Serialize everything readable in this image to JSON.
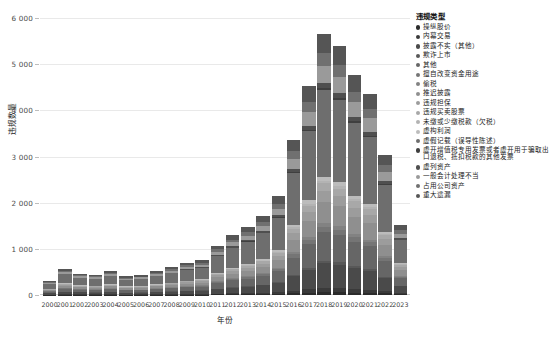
{
  "chart_data": {
    "type": "bar",
    "stacked": true,
    "title": "",
    "xlabel": "年份",
    "ylabel": "违规数量",
    "ylim": [
      0,
      6000
    ],
    "yticks": [
      0,
      1000,
      2000,
      3000,
      4000,
      5000,
      6000
    ],
    "ytick_labels": [
      "0",
      "1 000",
      "2 000",
      "3 000",
      "4 000",
      "5 000",
      "6 000"
    ],
    "grid": true,
    "legend_position": "right",
    "legend_title": "违规类型",
    "categories": [
      "2000",
      "2001",
      "2002",
      "2003",
      "2004",
      "2005",
      "2006",
      "2007",
      "2008",
      "2009",
      "2010",
      "2011",
      "2012",
      "2013",
      "2014",
      "2015",
      "2016",
      "2017",
      "2018",
      "2019",
      "2020",
      "2021",
      "2022",
      "2023"
    ],
    "totals": [
      300,
      575,
      470,
      445,
      530,
      415,
      440,
      530,
      610,
      700,
      760,
      1080,
      1310,
      1480,
      1720,
      2150,
      3390,
      4560,
      5700,
      5430,
      4790,
      4390,
      3060,
      1530
    ],
    "series": [
      {
        "name": "操纵股价",
        "color": "#2b2b2b",
        "values": [
          4,
          6,
          5,
          5,
          6,
          5,
          5,
          6,
          7,
          8,
          9,
          12,
          15,
          17,
          20,
          25,
          38,
          52,
          65,
          62,
          54,
          50,
          35,
          17
        ]
      },
      {
        "name": "内幕交易",
        "color": "#3a3a3a",
        "values": [
          5,
          9,
          7,
          7,
          8,
          6,
          7,
          8,
          9,
          11,
          12,
          17,
          21,
          23,
          27,
          34,
          53,
          72,
          90,
          86,
          76,
          69,
          48,
          24
        ]
      },
      {
        "name": "披露不实（其他）",
        "color": "#4a4a4a",
        "values": [
          28,
          54,
          44,
          42,
          50,
          39,
          41,
          50,
          57,
          66,
          71,
          101,
          123,
          139,
          161,
          202,
          318,
          428,
          535,
          510,
          450,
          412,
          287,
          144
        ]
      },
      {
        "name": "欺诈上市",
        "color": "#585858",
        "values": [
          3,
          5,
          4,
          4,
          5,
          4,
          4,
          5,
          6,
          6,
          7,
          10,
          12,
          14,
          16,
          20,
          31,
          42,
          53,
          50,
          44,
          40,
          28,
          14
        ]
      },
      {
        "name": "其他",
        "color": "#666666",
        "values": [
          33,
          63,
          52,
          49,
          58,
          46,
          48,
          58,
          67,
          77,
          84,
          119,
          144,
          163,
          189,
          236,
          373,
          501,
          627,
          597,
          527,
          483,
          337,
          168
        ]
      },
      {
        "name": "擅自改变资金用途",
        "color": "#757575",
        "values": [
          6,
          11,
          9,
          9,
          10,
          8,
          9,
          10,
          12,
          14,
          15,
          21,
          26,
          29,
          34,
          43,
          68,
          91,
          114,
          109,
          96,
          88,
          61,
          31
        ]
      },
      {
        "name": "偷税",
        "color": "#828282",
        "values": [
          4,
          8,
          6,
          6,
          7,
          6,
          6,
          7,
          8,
          10,
          10,
          15,
          18,
          20,
          24,
          30,
          47,
          63,
          79,
          75,
          66,
          61,
          42,
          21
        ]
      },
      {
        "name": "推迟披露",
        "color": "#8f8f8f",
        "values": [
          24,
          46,
          38,
          36,
          42,
          33,
          35,
          42,
          49,
          56,
          61,
          86,
          105,
          118,
          138,
          172,
          271,
          365,
          456,
          434,
          383,
          351,
          245,
          122
        ]
      },
      {
        "name": "违规担保",
        "color": "#9c9c9c",
        "values": [
          12,
          23,
          19,
          18,
          21,
          17,
          18,
          21,
          24,
          28,
          30,
          43,
          52,
          59,
          69,
          86,
          136,
          182,
          228,
          217,
          192,
          176,
          122,
          61
        ]
      },
      {
        "name": "违规买卖股票",
        "color": "#a8a8a8",
        "values": [
          9,
          17,
          14,
          13,
          16,
          12,
          13,
          16,
          18,
          21,
          23,
          32,
          39,
          44,
          52,
          65,
          102,
          137,
          171,
          163,
          144,
          132,
          92,
          46
        ]
      },
      {
        "name": "未缴或少缴税款（欠税）",
        "color": "#b3b3b3",
        "values": [
          3,
          6,
          5,
          4,
          5,
          4,
          4,
          5,
          6,
          7,
          8,
          11,
          13,
          15,
          17,
          22,
          34,
          46,
          57,
          54,
          48,
          44,
          31,
          15
        ]
      },
      {
        "name": "虚构利润",
        "color": "#bcbcbc",
        "values": [
          5,
          9,
          7,
          7,
          8,
          7,
          7,
          8,
          10,
          11,
          12,
          17,
          21,
          24,
          28,
          34,
          54,
          73,
          91,
          87,
          77,
          70,
          49,
          24
        ]
      },
      {
        "name": "虚假记载（误导性陈述）",
        "color": "#6e6e6e",
        "values": [
          99,
          190,
          155,
          147,
          175,
          137,
          145,
          175,
          201,
          231,
          251,
          356,
          432,
          489,
          568,
          710,
          1119,
          1505,
          1881,
          1792,
          1581,
          1449,
          1010,
          505
        ]
      },
      {
        "name": "虚开增值税专用发票或者虚开用于骗取出口退税、抵扣税款的其他发票",
        "color": "#3f3f3f",
        "values": [
          2,
          3,
          3,
          2,
          3,
          2,
          3,
          3,
          4,
          4,
          4,
          6,
          7,
          8,
          10,
          12,
          19,
          26,
          32,
          31,
          27,
          25,
          17,
          9
        ]
      },
      {
        "name": "虚列资产",
        "color": "#4f4f4f",
        "values": [
          6,
          11,
          9,
          9,
          10,
          8,
          9,
          10,
          12,
          14,
          15,
          21,
          26,
          29,
          34,
          43,
          68,
          91,
          114,
          109,
          96,
          88,
          61,
          31
        ]
      },
      {
        "name": "一般会计处理不当",
        "color": "#9a9a9a",
        "values": [
          20,
          38,
          31,
          29,
          35,
          27,
          29,
          35,
          40,
          46,
          50,
          71,
          86,
          97,
          113,
          141,
          222,
          299,
          374,
          356,
          314,
          288,
          201,
          100
        ]
      },
      {
        "name": "占用公司资产",
        "color": "#707070",
        "values": [
          14,
          27,
          22,
          21,
          25,
          19,
          21,
          25,
          29,
          33,
          36,
          51,
          62,
          70,
          81,
          102,
          160,
          216,
          270,
          257,
          227,
          208,
          145,
          72
        ]
      },
      {
        "name": "重大遗漏",
        "color": "#555555",
        "values": [
          23,
          44,
          36,
          34,
          40,
          32,
          33,
          40,
          46,
          53,
          57,
          81,
          99,
          112,
          130,
          162,
          256,
          344,
          430,
          410,
          361,
          331,
          231,
          115
        ]
      },
      {
        "name": "虚构利润（其他）",
        "color": "#c6c6c6",
        "values": [
          0,
          0,
          0,
          0,
          0,
          0,
          0,
          0,
          0,
          0,
          0,
          0,
          0,
          0,
          0,
          0,
          0,
          0,
          0,
          0,
          0,
          0,
          0,
          0
        ]
      }
    ]
  },
  "legend": {
    "title": "违规类型",
    "items": [
      {
        "label": "操纵股价",
        "color": "#2b2b2b"
      },
      {
        "label": "内幕交易",
        "color": "#3a3a3a"
      },
      {
        "label": "披露不实（其他）",
        "color": "#4a4a4a"
      },
      {
        "label": "欺诈上市",
        "color": "#585858"
      },
      {
        "label": "其他",
        "color": "#666666"
      },
      {
        "label": "擅自改变资金用途",
        "color": "#757575"
      },
      {
        "label": "偷税",
        "color": "#828282"
      },
      {
        "label": "推迟披露",
        "color": "#8f8f8f"
      },
      {
        "label": "违规担保",
        "color": "#9c9c9c"
      },
      {
        "label": "违规买卖股票",
        "color": "#a8a8a8"
      },
      {
        "label": "未缴或少缴税款（欠税）",
        "color": "#b3b3b3"
      },
      {
        "label": "虚构利润",
        "color": "#bcbcbc"
      },
      {
        "label": "虚假记载（误导性陈述）",
        "color": "#6e6e6e"
      },
      {
        "label": "虚开增值税专用发票或者虚开用于骗取出口退税、抵扣税款的其他发票",
        "color": "#3f3f3f"
      },
      {
        "label": "虚列资产",
        "color": "#4f4f4f"
      },
      {
        "label": "一般会计处理不当",
        "color": "#9a9a9a"
      },
      {
        "label": "占用公司资产",
        "color": "#707070"
      },
      {
        "label": "重大遗漏",
        "color": "#555555"
      }
    ]
  }
}
